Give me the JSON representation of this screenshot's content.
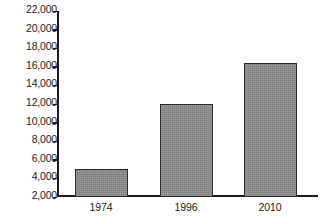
{
  "chart_data": {
    "type": "bar",
    "title": "",
    "subtitle": "",
    "xlabel": "",
    "ylabel": "",
    "categories": [
      "1974",
      "1996",
      "2010"
    ],
    "values": [
      5000,
      12000,
      16400
    ],
    "series": [
      {
        "name": "",
        "values": [
          5000,
          12000,
          16400
        ]
      }
    ],
    "ylim": [
      2000,
      22000
    ],
    "ytick_step": 2000,
    "yticks": [
      2000,
      4000,
      6000,
      8000,
      10000,
      12000,
      14000,
      16000,
      18000,
      20000,
      22000
    ],
    "ytick_labels": [
      "22,000",
      "20,000",
      "18,000",
      "16,000",
      "14,000",
      "12,000",
      "10,000",
      "8,000",
      "6,000",
      "4,000",
      "2,000"
    ],
    "xtick_labels": [
      "1974",
      "1996",
      "2010"
    ],
    "grid": false,
    "legend": false,
    "legend_position": "none",
    "annotations": [],
    "bar_fill_color": "#8d8d8d",
    "bar_border_color": "#2a2a2a",
    "axis_color": "#1b1b1b",
    "background_color": "#ffffff",
    "text_color": "#1b1b1b"
  }
}
